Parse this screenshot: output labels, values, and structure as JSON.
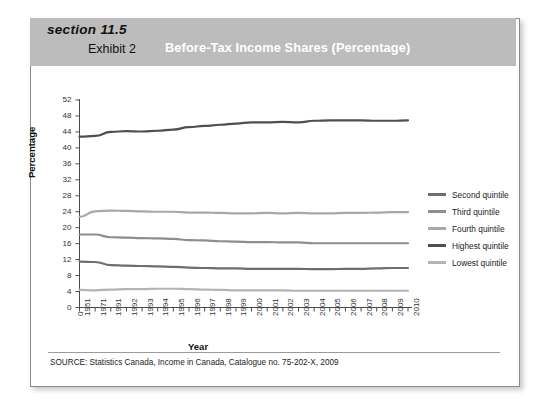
{
  "header": {
    "section_label": "section 11.5",
    "exhibit_label": "Exhibit 2",
    "title": "Before-Tax Income Shares (Percentage)",
    "band_color": "#bcbcbc",
    "title_color": "#ffffff"
  },
  "source_note": "SOURCE: Statistics Canada, Income in Canada, Catalogue no. 75-202-X, 2009",
  "legend": {
    "items": [
      {
        "label": "Second quintile",
        "color": "#6e6e6e"
      },
      {
        "label": "Third quintile",
        "color": "#8e8e8e"
      },
      {
        "label": "Fourth quintile",
        "color": "#a8a8a8"
      },
      {
        "label": "Highest quintile",
        "color": "#4f4f4f"
      },
      {
        "label": "Lowest quintile",
        "color": "#b4b4b4"
      }
    ]
  },
  "chart_data": {
    "type": "line",
    "title": "Before-Tax Income Shares (Percentage)",
    "xlabel": "Year",
    "ylabel": "Percentage",
    "ylim": [
      0,
      52
    ],
    "ytick_step": 4,
    "yticks": [
      0,
      4,
      8,
      12,
      16,
      20,
      24,
      28,
      32,
      36,
      40,
      44,
      48,
      52
    ],
    "grid": false,
    "legend_position": "right",
    "categories": [
      "1951",
      "1971",
      "1991",
      "1992",
      "1993",
      "1994",
      "1995",
      "1996",
      "1997",
      "1998",
      "1999",
      "2000",
      "2001",
      "2002",
      "2003",
      "2004",
      "2005",
      "2006",
      "2007",
      "2008",
      "2009",
      "2010"
    ],
    "series": [
      {
        "name": "Highest quintile",
        "color": "#4f4f4f",
        "values": [
          42.8,
          43.0,
          44.0,
          44.2,
          44.1,
          44.3,
          44.6,
          45.2,
          45.5,
          45.8,
          46.1,
          46.4,
          46.4,
          46.5,
          46.4,
          46.8,
          46.9,
          46.9,
          46.9,
          46.8,
          46.8,
          46.9
        ]
      },
      {
        "name": "Fourth quintile",
        "color": "#a8a8a8",
        "values": [
          22.7,
          24.1,
          24.3,
          24.2,
          24.1,
          24.0,
          24.0,
          23.8,
          23.8,
          23.7,
          23.6,
          23.6,
          23.7,
          23.6,
          23.7,
          23.6,
          23.6,
          23.7,
          23.7,
          23.8,
          23.9,
          23.9
        ]
      },
      {
        "name": "Third quintile",
        "color": "#8e8e8e",
        "values": [
          18.3,
          18.3,
          17.6,
          17.5,
          17.4,
          17.3,
          17.2,
          16.9,
          16.8,
          16.6,
          16.5,
          16.4,
          16.4,
          16.3,
          16.3,
          16.1,
          16.1,
          16.1,
          16.1,
          16.1,
          16.1,
          16.1
        ]
      },
      {
        "name": "Second quintile",
        "color": "#6e6e6e",
        "values": [
          11.5,
          11.4,
          10.6,
          10.5,
          10.4,
          10.3,
          10.2,
          10.0,
          9.9,
          9.8,
          9.8,
          9.7,
          9.7,
          9.7,
          9.7,
          9.6,
          9.6,
          9.7,
          9.7,
          9.8,
          9.9,
          9.9
        ]
      },
      {
        "name": "Lowest quintile",
        "color": "#b4b4b4",
        "values": [
          4.4,
          4.3,
          4.5,
          4.6,
          4.6,
          4.7,
          4.7,
          4.6,
          4.5,
          4.4,
          4.3,
          4.3,
          4.3,
          4.3,
          4.2,
          4.2,
          4.2,
          4.2,
          4.2,
          4.2,
          4.2,
          4.2
        ]
      }
    ]
  }
}
